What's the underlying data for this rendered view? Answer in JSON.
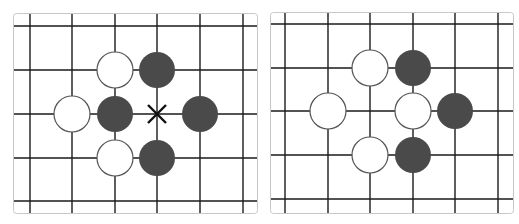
{
  "colors": {
    "background": "#ffffff",
    "grid_line": "#1a1a1a",
    "panel_border": "#c8c8c8",
    "black_stone": "#4a4a4a",
    "white_stone_fill": "#ffffff",
    "white_stone_stroke": "#555555",
    "marker": "#111111"
  },
  "boards": [
    {
      "name": "left-board",
      "panel": {
        "x": 13,
        "y": 13,
        "w": 244,
        "h": 200
      },
      "vlines": [
        30,
        72,
        115,
        157,
        200,
        243
      ],
      "hlines": [
        26,
        70,
        114,
        158,
        201
      ],
      "stones": [
        {
          "color": "white",
          "x": 115,
          "y": 70
        },
        {
          "color": "black",
          "x": 157,
          "y": 70
        },
        {
          "color": "white",
          "x": 72,
          "y": 114
        },
        {
          "color": "black",
          "x": 115,
          "y": 114
        },
        {
          "color": "black",
          "x": 200,
          "y": 114
        },
        {
          "color": "white",
          "x": 115,
          "y": 158
        },
        {
          "color": "black",
          "x": 157,
          "y": 158
        }
      ],
      "markers": [
        {
          "type": "x-mark",
          "x": 157,
          "y": 114
        }
      ]
    },
    {
      "name": "right-board",
      "panel": {
        "x": 270,
        "y": 12,
        "w": 243,
        "h": 201
      },
      "vlines": [
        285,
        328,
        370,
        413,
        455,
        498
      ],
      "hlines": [
        24,
        68,
        111,
        155,
        199
      ],
      "stones": [
        {
          "color": "white",
          "x": 370,
          "y": 68
        },
        {
          "color": "black",
          "x": 413,
          "y": 68
        },
        {
          "color": "white",
          "x": 328,
          "y": 111
        },
        {
          "color": "white",
          "x": 413,
          "y": 111
        },
        {
          "color": "black",
          "x": 455,
          "y": 111
        },
        {
          "color": "white",
          "x": 370,
          "y": 155
        },
        {
          "color": "black",
          "x": 413,
          "y": 155
        }
      ],
      "markers": []
    }
  ],
  "stone_radius": 18
}
